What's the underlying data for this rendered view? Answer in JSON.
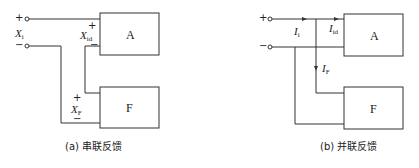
{
  "diagram_a": {
    "caption": "(a) 串联反馈",
    "input_label": "X",
    "input_sub": "i",
    "diff_label": "X",
    "diff_sub": "id",
    "feedback_label": "X",
    "feedback_sub": "F",
    "plus": "+",
    "minus": "−",
    "amp_block": "A",
    "fb_block": "F"
  },
  "diagram_b": {
    "caption": "(b) 并联反馈",
    "input_label": "I",
    "input_sub": "i",
    "diff_label": "I",
    "diff_sub": "id",
    "feedback_label": "I",
    "feedback_sub": "F",
    "plus": "+",
    "minus": "−",
    "amp_block": "A",
    "fb_block": "F"
  },
  "colors": {
    "line": "#333333",
    "background": "#ffffff"
  }
}
